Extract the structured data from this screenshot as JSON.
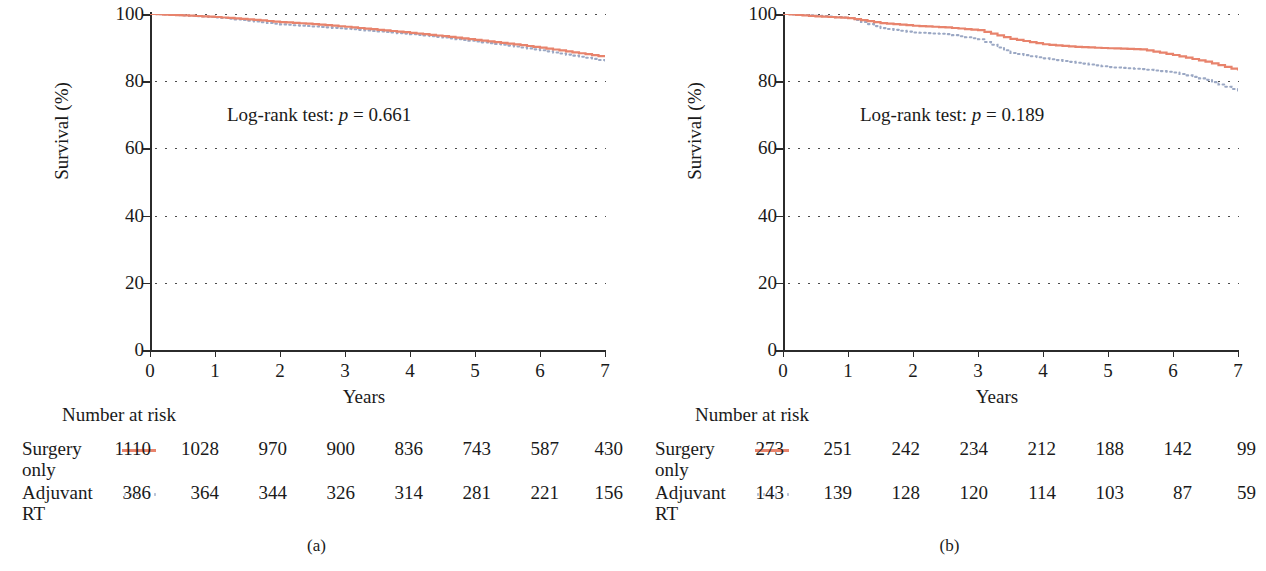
{
  "figure": {
    "panels": [
      {
        "caption": "(a)",
        "pvalue_text": "Log-rank test: ",
        "pvalue_p": "p",
        "pvalue_eq": " = 0.661",
        "axis": {
          "y_title": "Survival (%)",
          "x_title": "Years",
          "y_ticks": [
            "0",
            "20",
            "40",
            "60",
            "80",
            "100"
          ],
          "x_ticks": [
            "0",
            "1",
            "2",
            "3",
            "4",
            "5",
            "6",
            "7"
          ]
        },
        "risk": {
          "title": "Number at risk",
          "rows": [
            {
              "name": "Surgery\nonly",
              "style": "solid",
              "values": [
                "1110",
                "1028",
                "970",
                "900",
                "836",
                "743",
                "587",
                "430"
              ]
            },
            {
              "name": "Adjuvant\nRT",
              "style": "dotted",
              "values": [
                "386",
                "364",
                "344",
                "326",
                "314",
                "281",
                "221",
                "156"
              ]
            }
          ]
        }
      },
      {
        "caption": "(b)",
        "pvalue_text": "Log-rank test: ",
        "pvalue_p": "p",
        "pvalue_eq": " = 0.189",
        "axis": {
          "y_title": "Survival (%)",
          "x_title": "Years",
          "y_ticks": [
            "0",
            "20",
            "40",
            "60",
            "80",
            "100"
          ],
          "x_ticks": [
            "0",
            "1",
            "2",
            "3",
            "4",
            "5",
            "6",
            "7"
          ]
        },
        "risk": {
          "title": "Number at risk",
          "rows": [
            {
              "name": "Surgery\nonly",
              "style": "solid",
              "values": [
                "273",
                "251",
                "242",
                "234",
                "212",
                "188",
                "142",
                "99"
              ]
            },
            {
              "name": "Adjuvant\nRT",
              "style": "dotted",
              "values": [
                "143",
                "139",
                "128",
                "120",
                "114",
                "103",
                "87",
                "59"
              ]
            }
          ]
        }
      }
    ]
  },
  "colors": {
    "surgery_only": "#e8836c",
    "adjuvant_rt": "#9ba8c4",
    "axis": "#2b2b2b",
    "grid": "#4a4a4a"
  },
  "chart_data": [
    {
      "type": "line",
      "title": "(a)",
      "xlabel": "Years",
      "ylabel": "Survival (%)",
      "xlim": [
        0,
        7
      ],
      "ylim": [
        0,
        100
      ],
      "yticks": [
        0,
        20,
        40,
        60,
        80,
        100
      ],
      "xticks": [
        0,
        1,
        2,
        3,
        4,
        5,
        6,
        7
      ],
      "grid": true,
      "legend": "number-at-risk table below plot",
      "annotations": [
        "Log-rank test: p = 0.661"
      ],
      "series": [
        {
          "name": "Surgery only",
          "style": "solid",
          "color": "#e8836c",
          "x": [
            0,
            0.5,
            1,
            1.5,
            2,
            2.5,
            3,
            3.5,
            4,
            4.5,
            5,
            5.5,
            6,
            6.5,
            7
          ],
          "values": [
            100,
            99.6,
            99.1,
            98.4,
            97.6,
            97.0,
            96.2,
            95.3,
            94.4,
            93.4,
            92.3,
            91.2,
            90.0,
            88.6,
            87.2
          ]
        },
        {
          "name": "Adjuvant RT",
          "style": "dotted",
          "color": "#9ba8c4",
          "x": [
            0,
            0.5,
            1,
            1.5,
            2,
            2.5,
            3,
            3.5,
            4,
            4.5,
            5,
            5.5,
            6,
            6.5,
            7
          ],
          "values": [
            100,
            99.6,
            99.0,
            98.0,
            96.9,
            96.3,
            95.6,
            94.8,
            94.0,
            93.0,
            91.8,
            90.6,
            89.2,
            87.6,
            86.0
          ]
        }
      ],
      "risk_table": {
        "times": [
          0,
          1,
          2,
          3,
          4,
          5,
          6,
          7
        ],
        "rows": [
          {
            "name": "Surgery only",
            "counts": [
              1110,
              1028,
              970,
              900,
              836,
              743,
              587,
              430
            ]
          },
          {
            "name": "Adjuvant RT",
            "counts": [
              386,
              364,
              344,
              326,
              314,
              281,
              221,
              156
            ]
          }
        ]
      }
    },
    {
      "type": "line",
      "title": "(b)",
      "xlabel": "Years",
      "ylabel": "Survival (%)",
      "xlim": [
        0,
        7
      ],
      "ylim": [
        0,
        100
      ],
      "yticks": [
        0,
        20,
        40,
        60,
        80,
        100
      ],
      "xticks": [
        0,
        1,
        2,
        3,
        4,
        5,
        6,
        7
      ],
      "grid": true,
      "legend": "number-at-risk table below plot",
      "annotations": [
        "Log-rank test: p = 0.189"
      ],
      "series": [
        {
          "name": "Surgery only",
          "style": "solid",
          "color": "#e8836c",
          "x": [
            0,
            0.5,
            1,
            1.5,
            2,
            2.5,
            3,
            3.5,
            4,
            4.5,
            5,
            5.5,
            6,
            6.5,
            7
          ],
          "values": [
            100,
            99.3,
            98.8,
            97.3,
            96.5,
            96.0,
            95.2,
            92.6,
            91.0,
            90.2,
            89.8,
            89.5,
            87.8,
            85.8,
            83.2
          ]
        },
        {
          "name": "Adjuvant RT",
          "style": "dotted",
          "color": "#9ba8c4",
          "x": [
            0,
            0.5,
            1,
            1.5,
            2,
            2.5,
            3,
            3.5,
            4,
            4.5,
            5,
            5.5,
            6,
            6.5,
            7
          ],
          "values": [
            100,
            99.5,
            98.8,
            95.8,
            94.5,
            94.0,
            92.5,
            88.4,
            86.8,
            85.5,
            84.2,
            83.6,
            82.6,
            80.4,
            77.0
          ]
        }
      ],
      "risk_table": {
        "times": [
          0,
          1,
          2,
          3,
          4,
          5,
          6,
          7
        ],
        "rows": [
          {
            "name": "Surgery only",
            "counts": [
              273,
              251,
              242,
              234,
              212,
              188,
              142,
              99
            ]
          },
          {
            "name": "Adjuvant RT",
            "counts": [
              143,
              139,
              128,
              120,
              114,
              103,
              87,
              59
            ]
          }
        ]
      }
    }
  ]
}
